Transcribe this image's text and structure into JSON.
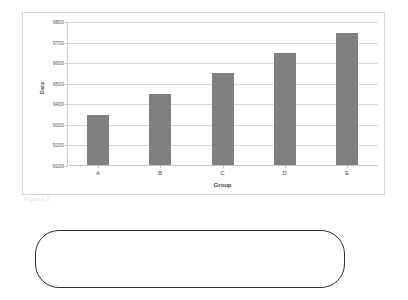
{
  "chart_data": {
    "type": "bar",
    "title": "",
    "xlabel": "Group",
    "ylabel": "Data",
    "categories": [
      "A",
      "B",
      "C",
      "D",
      "E"
    ],
    "values": [
      9345,
      9445,
      9548,
      9645,
      9742
    ],
    "ylim": [
      9100,
      9800
    ],
    "yticks": [
      9100,
      9200,
      9300,
      9400,
      9500,
      9600,
      9700,
      9800
    ],
    "ytick_labels": [
      "9100",
      "9200",
      "9300",
      "9400",
      "9500",
      "9600",
      "9700",
      "9800"
    ],
    "grid": true,
    "legend": false,
    "bar_color": "#808080",
    "gridline_color": "#d9d9d9",
    "frame_color": "#d6d6d6"
  },
  "caption": {
    "fragment_text": "Figure 2"
  },
  "rounded_box": {
    "text": "",
    "border_color": "#2e2e2e"
  }
}
